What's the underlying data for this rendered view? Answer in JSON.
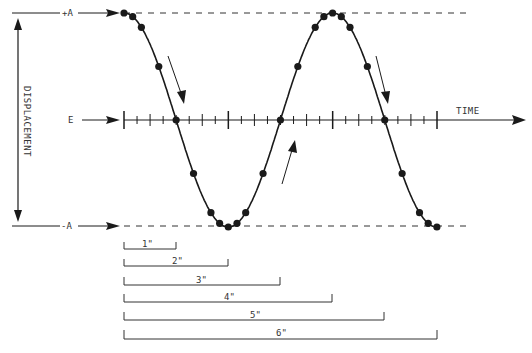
{
  "diagram": {
    "labels": {
      "plus_a": "+A",
      "minus_a": "-A",
      "equilibrium": "E",
      "time_axis": "TIME",
      "displacement_axis": "DISPLACEMENT"
    },
    "colors": {
      "ink": "#1a1a1a",
      "text": "#333333",
      "background": "#ffffff"
    },
    "scale_brackets": [
      {
        "label": "1\""
      },
      {
        "label": "2\""
      },
      {
        "label": "3\""
      },
      {
        "label": "4\""
      },
      {
        "label": "5\""
      },
      {
        "label": "6\""
      }
    ]
  }
}
